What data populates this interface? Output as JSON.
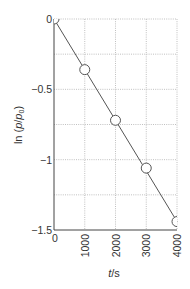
{
  "chart_data": {
    "type": "scatter",
    "title": "",
    "xlabel": "t/s",
    "ylabel": "ln (p/p0)",
    "xlim": [
      0,
      4000
    ],
    "ylim": [
      -1.5,
      0
    ],
    "x_ticks": [
      0,
      1000,
      2000,
      3000,
      4000
    ],
    "x_tick_labels": [
      "0",
      "1000",
      "2000",
      "3000",
      "4000"
    ],
    "y_ticks": [
      0,
      -0.5,
      -1,
      -1.5
    ],
    "y_tick_labels": [
      "0",
      "-0.5",
      "-1",
      "-1.5"
    ],
    "y_grid_minor": [
      -0.25,
      -0.75,
      -1.25
    ],
    "grid": true,
    "series": [
      {
        "name": "data",
        "x": [
          0,
          1000,
          2000,
          3000,
          4000
        ],
        "y": [
          0,
          -0.36,
          -0.72,
          -1.06,
          -1.44
        ],
        "marker": "open-circle"
      }
    ],
    "fit_line": {
      "x": [
        0,
        4000
      ],
      "y": [
        0,
        -1.44
      ]
    }
  }
}
